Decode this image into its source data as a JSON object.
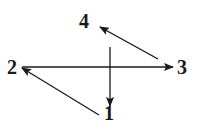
{
  "diagram": {
    "type": "directed-graph",
    "nodes": [
      {
        "id": "1",
        "label": "1"
      },
      {
        "id": "2",
        "label": "2"
      },
      {
        "id": "3",
        "label": "3"
      },
      {
        "id": "4",
        "label": "4"
      }
    ],
    "edges": [
      {
        "from": "2",
        "to": "3",
        "style": "solid"
      },
      {
        "from": "3",
        "to": "4",
        "style": "solid"
      },
      {
        "from": "1",
        "to": "2",
        "style": "solid"
      },
      {
        "from": "4",
        "to": "1",
        "style": "solid",
        "note": "vertical arrow pointing down toward 1"
      }
    ],
    "colors": {
      "stroke": "#1a1a1a",
      "background": "#ffffff"
    }
  }
}
